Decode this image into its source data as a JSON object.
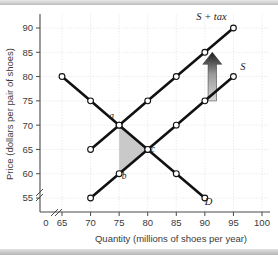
{
  "figure": {
    "background_color": "#ffffff",
    "curve_color": "#111111",
    "shade_color": "#c9c9c9",
    "grid_color": "#d6d6d6",
    "axis_color": "#4a4a4a"
  },
  "chart_data": {
    "type": "line",
    "title": "",
    "xlabel": "Quantity (millions of shoes per year)",
    "ylabel": "Price (dollars per pair of shoes)",
    "xlim": [
      63,
      101
    ],
    "ylim": [
      53,
      92
    ],
    "xticks": [
      "0",
      "65",
      "70",
      "75",
      "80",
      "85",
      "90",
      "95",
      "100"
    ],
    "yticks": [
      "55",
      "60",
      "65",
      "70",
      "75",
      "80",
      "85",
      "90"
    ],
    "grid": true,
    "axis_break_x": true,
    "axis_break_y": true,
    "legend_position": "inline-curve-labels",
    "series": [
      {
        "name": "D",
        "label": "D",
        "label_x": 90,
        "label_y": 53.6,
        "points": [
          {
            "x": 65,
            "y": 80
          },
          {
            "x": 70,
            "y": 75
          },
          {
            "x": 75,
            "y": 70
          },
          {
            "x": 80,
            "y": 65
          },
          {
            "x": 85,
            "y": 60
          },
          {
            "x": 90,
            "y": 55
          }
        ]
      },
      {
        "name": "S",
        "label": "S",
        "label_x": 96.2,
        "label_y": 81.4,
        "points": [
          {
            "x": 70,
            "y": 55
          },
          {
            "x": 75,
            "y": 60
          },
          {
            "x": 80,
            "y": 65
          },
          {
            "x": 85,
            "y": 70
          },
          {
            "x": 90,
            "y": 75
          },
          {
            "x": 95,
            "y": 80
          }
        ]
      },
      {
        "name": "S + tax",
        "label": "S + tax",
        "label_x": 88.5,
        "label_y": 91.6,
        "points": [
          {
            "x": 70,
            "y": 65
          },
          {
            "x": 75,
            "y": 70
          },
          {
            "x": 80,
            "y": 75
          },
          {
            "x": 85,
            "y": 80
          },
          {
            "x": 90,
            "y": 85
          },
          {
            "x": 95,
            "y": 90
          }
        ]
      }
    ],
    "annotations": [
      {
        "name": "point-a",
        "label": "a",
        "x": 75,
        "y": 70,
        "label_dx": -5.2,
        "label_dy": 2.6
      },
      {
        "name": "point-b",
        "label": "b",
        "x": 75,
        "y": 60,
        "label_dx": 1.4,
        "label_dy": -2.2
      },
      {
        "name": "point-c",
        "label": "c",
        "x": 80,
        "y": 65,
        "label_dx": 1.6,
        "label_dy": -1.2
      }
    ],
    "shaded_region": {
      "name": "deadweight-loss-triangle",
      "vertices": [
        {
          "x": 75,
          "y": 70
        },
        {
          "x": 80,
          "y": 65
        },
        {
          "x": 75,
          "y": 60
        }
      ]
    },
    "tax_arrow": {
      "name": "tax-wedge-arrow",
      "direction": "up",
      "x": 91.3,
      "y_from": 75,
      "y_to": 85
    }
  }
}
